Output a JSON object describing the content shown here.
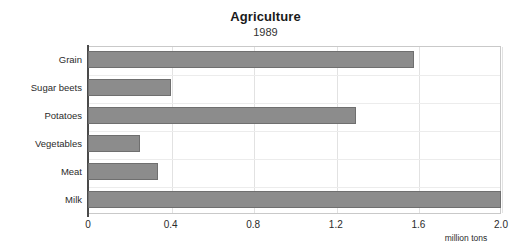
{
  "chart_data": {
    "type": "bar",
    "orientation": "horizontal",
    "title": "Agriculture",
    "subtitle": "1989",
    "xlabel": "million tons",
    "ylabel": "",
    "categories": [
      "Grain",
      "Sugar beets",
      "Potatoes",
      "Vegetables",
      "Meat",
      "Milk"
    ],
    "values": [
      1.58,
      0.4,
      1.3,
      0.25,
      0.34,
      2.0
    ],
    "xlim": [
      0,
      2.0
    ],
    "xticks": [
      0,
      0.4,
      0.8,
      1.2,
      1.6,
      2.0
    ],
    "xtick_labels": [
      "0",
      "0.4",
      "0.8",
      "1.2",
      "1.6",
      "2.0"
    ],
    "grid": true,
    "legend": false,
    "bar_color": "#8c8c8c",
    "bar_border_color": "#6f6f6f",
    "background_color": "#ffffff"
  }
}
